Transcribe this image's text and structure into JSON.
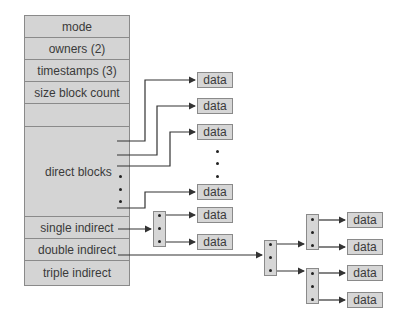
{
  "inode": {
    "rows": [
      {
        "label": "mode"
      },
      {
        "label": "owners (2)"
      },
      {
        "label": "timestamps (3)"
      },
      {
        "label": "size block count"
      },
      {
        "label": ""
      },
      {
        "label": "direct blocks"
      },
      {
        "label": "single indirect"
      },
      {
        "label": "double indirect"
      },
      {
        "label": "triple indirect"
      }
    ]
  },
  "data_blocks": {
    "direct": [
      "data",
      "data",
      "data",
      "data"
    ],
    "single_indirect": [
      "data",
      "data"
    ],
    "double_indirect": [
      "data",
      "data",
      "data",
      "data"
    ]
  },
  "colors": {
    "box_fill": "#d4d4d4",
    "box_border": "#8a8a8a",
    "line": "#333333"
  }
}
